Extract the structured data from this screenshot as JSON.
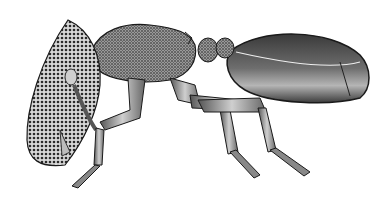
{
  "image": {
    "subject": "ant illustration, lateral view",
    "style": "black and white stippled scientific drawing",
    "background": "#ffffff",
    "ink": "#1a1a1a"
  }
}
